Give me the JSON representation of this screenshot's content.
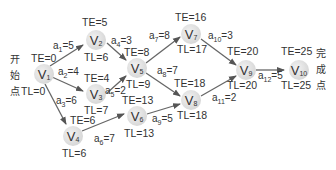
{
  "start_label": [
    "开",
    "始",
    "点"
  ],
  "end_label": [
    "完",
    "成",
    "点"
  ],
  "nodes": [
    {
      "id": "V1",
      "name": "V",
      "sub": "1",
      "te": "TE=0",
      "tl": "TL=0"
    },
    {
      "id": "V2",
      "name": "V",
      "sub": "2",
      "te": "TE=5",
      "tl": "TL=6"
    },
    {
      "id": "V3",
      "name": "V",
      "sub": "3",
      "te": "TE=4",
      "tl": "TL=7"
    },
    {
      "id": "V4",
      "name": "V",
      "sub": "4",
      "te": "TE=6",
      "tl": "TL=6"
    },
    {
      "id": "V5",
      "name": "V",
      "sub": "5",
      "te": "TE=8",
      "tl": "TL=9"
    },
    {
      "id": "V6",
      "name": "V",
      "sub": "6",
      "te": "TE=13",
      "tl": "TL=13"
    },
    {
      "id": "V7",
      "name": "V",
      "sub": "7",
      "te": "TE=16",
      "tl": "TL=17"
    },
    {
      "id": "V8",
      "name": "V",
      "sub": "8",
      "te": "TE=18",
      "tl": "TL=18"
    },
    {
      "id": "V9",
      "name": "V",
      "sub": "9",
      "te": "TE=20",
      "tl": "TL=20"
    },
    {
      "id": "V10",
      "name": "V",
      "sub": "10",
      "te": "TE=25",
      "tl": "TL=25"
    }
  ],
  "edges": [
    {
      "id": "a1",
      "from": "V1",
      "to": "V2",
      "name": "a",
      "sub": "1",
      "weight": "=5"
    },
    {
      "id": "a2",
      "from": "V1",
      "to": "V3",
      "name": "a",
      "sub": "2",
      "weight": "=4"
    },
    {
      "id": "a3",
      "from": "V1",
      "to": "V4",
      "name": "a",
      "sub": "3",
      "weight": "=6"
    },
    {
      "id": "a4",
      "from": "V2",
      "to": "V5",
      "name": "a",
      "sub": "4",
      "weight": "=3"
    },
    {
      "id": "a5",
      "from": "V3",
      "to": "V5",
      "name": "a",
      "sub": "5",
      "weight": "=2"
    },
    {
      "id": "a6",
      "from": "V4",
      "to": "V6",
      "name": "a",
      "sub": "6",
      "weight": "=7"
    },
    {
      "id": "a7",
      "from": "V5",
      "to": "V7",
      "name": "a",
      "sub": "7",
      "weight": "=8"
    },
    {
      "id": "a8",
      "from": "V5",
      "to": "V8",
      "name": "a",
      "sub": "8",
      "weight": "=7"
    },
    {
      "id": "a9",
      "from": "V6",
      "to": "V8",
      "name": "a",
      "sub": "9",
      "weight": "=5"
    },
    {
      "id": "a10",
      "from": "V7",
      "to": "V9",
      "name": "a",
      "sub": "10",
      "weight": "=3"
    },
    {
      "id": "a11",
      "from": "V8",
      "to": "V9",
      "name": "a",
      "sub": "11",
      "weight": "=2"
    },
    {
      "id": "a12",
      "from": "V9",
      "to": "V10",
      "name": "a",
      "sub": "12",
      "weight": "=5"
    }
  ]
}
